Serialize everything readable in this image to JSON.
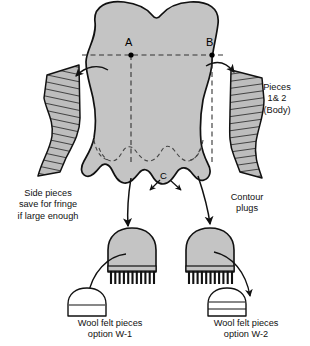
{
  "diagram": {
    "colors": {
      "body_fill": "#c4c4c4",
      "hatch_fill": "#b8b8b8",
      "outline": "#111111",
      "dashed_guide": "#333333",
      "felt_fill": "#ffffff",
      "background": "#ffffff"
    },
    "points": [
      {
        "id": "point-a",
        "label": "A"
      },
      {
        "id": "point-b",
        "label": "B"
      },
      {
        "id": "point-c",
        "label": "C"
      }
    ],
    "labels": {
      "side_pieces": "Side pieces\nsave for fringe\nif large enough",
      "side_pieces_line1": "Side pieces",
      "side_pieces_line2": "save for fringe",
      "side_pieces_line3": "if large enough",
      "pieces_line1": "Pieces",
      "pieces_line2": "1& 2",
      "pieces_line3": "(Body)",
      "contour_line1": "Contour",
      "contour_line2": "plugs",
      "wool_w1_line1": "Wool felt pieces",
      "wool_w1_line2": "option W-1",
      "wool_w2_line1": "Wool felt pieces",
      "wool_w2_line2": "option W-2"
    },
    "parts": {
      "body": "main body pattern piece",
      "side_piece_left": "left hatched side piece",
      "side_piece_right": "right hatched side piece",
      "plug_left": "left contour plug with fringe",
      "plug_right": "right contour plug with fringe",
      "felt_w1": "wool felt dome option W-1",
      "felt_w2": "wool felt dome option W-2"
    },
    "felt_detail_lines": {
      "w1": 1,
      "w2": 2
    }
  }
}
